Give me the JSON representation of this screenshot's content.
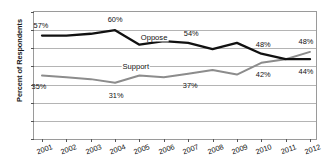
{
  "chart_data": {
    "type": "line",
    "title": "",
    "xlabel": "",
    "ylabel": "Percent of Respondents",
    "ylim": [
      0,
      70
    ],
    "ytick_step": 10,
    "yticks": [
      0,
      10,
      20,
      30,
      40,
      50,
      60,
      70
    ],
    "grid": true,
    "legend_position": "inline-labels",
    "categories": [
      "2001",
      "2002",
      "2003",
      "2004",
      "2005",
      "2006",
      "2007",
      "2008",
      "2009",
      "2010",
      "2011",
      "2012"
    ],
    "series": [
      {
        "name": "Oppose",
        "color": "#111111",
        "values": [
          57,
          57,
          58,
          60,
          52,
          54,
          53,
          49.5,
          53,
          47,
          44,
          44
        ],
        "point_labels": [
          {
            "category": "2001",
            "value": 57,
            "text": "57%"
          },
          {
            "category": "2004",
            "value": 60,
            "text": "60%"
          },
          {
            "category": "2007",
            "value": 53,
            "text": "54%"
          },
          {
            "category": "2010",
            "value": 47,
            "text": "48%"
          },
          {
            "category": "2012",
            "value": 44,
            "text": "44%"
          }
        ]
      },
      {
        "name": "Support",
        "color": "#8c8c8c",
        "values": [
          35,
          34,
          33,
          31,
          35,
          34,
          36,
          38,
          35.5,
          42,
          44,
          48
        ],
        "point_labels": [
          {
            "category": "2001",
            "value": 35,
            "text": "35%"
          },
          {
            "category": "2004",
            "value": 31,
            "text": "31%"
          },
          {
            "category": "2007",
            "value": 36,
            "text": "37%"
          },
          {
            "category": "2010",
            "value": 42,
            "text": "42%"
          },
          {
            "category": "2012",
            "value": 48,
            "text": "48%"
          }
        ]
      }
    ]
  },
  "yticks": {
    "t0": "0",
    "t1": "10",
    "t2": "20",
    "t3": "30",
    "t4": "40",
    "t5": "50",
    "t6": "60",
    "t7": "70"
  },
  "axis": {
    "y_title": "Percent of Respondents"
  },
  "xticks": {
    "x0": "2001",
    "x1": "2002",
    "x2": "2003",
    "x3": "2004",
    "x4": "2005",
    "x5": "2006",
    "x6": "2007",
    "x7": "2008",
    "x8": "2009",
    "x9": "2010",
    "x10": "2011",
    "x11": "2012"
  },
  "series_names": {
    "oppose": "Oppose",
    "support": "Support"
  },
  "value_labels": {
    "oppose_2001": "57%",
    "oppose_2004": "60%",
    "oppose_2007": "54%",
    "oppose_2010": "48%",
    "oppose_2012": "44%",
    "support_2001": "35%",
    "support_2004": "31%",
    "support_2007": "37%",
    "support_2010": "42%",
    "support_2012": "48%"
  }
}
